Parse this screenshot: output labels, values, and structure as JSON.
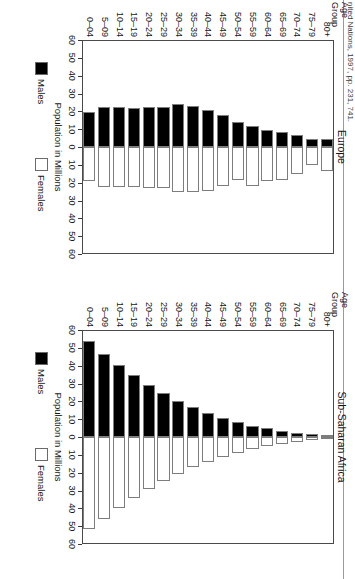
{
  "figure": {
    "source_note": "nited Nations, 1997, pp. 231, 741.",
    "orientation_note": "rotated-90"
  },
  "axis": {
    "value_axis_label": "Population in Millions",
    "category_axis_header_line1": "Age",
    "category_axis_header_line2": "Group",
    "ticks": [
      "60",
      "50",
      "40",
      "30",
      "20",
      "10",
      "0",
      "10",
      "20",
      "30",
      "40",
      "50",
      "60"
    ],
    "tick_values": [
      -60,
      -50,
      -40,
      -30,
      -20,
      -10,
      0,
      10,
      20,
      30,
      40,
      50,
      60
    ],
    "limit": 60
  },
  "legend": {
    "males_label": "Males",
    "females_label": "Females",
    "males_color": "#000000",
    "females_color": "#ffffff"
  },
  "chart_data": [
    {
      "type": "bar",
      "title": "Sub-Saharan Africa",
      "xlabel": "Population in Millions",
      "ylabel": "Age Group",
      "xlim": [
        -60,
        60
      ],
      "grid": false,
      "legend_position": "bottom",
      "categories": [
        "80+",
        "75–79",
        "70–74",
        "65–69",
        "60–64",
        "55–59",
        "50–54",
        "45–49",
        "40–44",
        "35–39",
        "30–34",
        "25–29",
        "20–24",
        "15–19",
        "10–14",
        "5–09",
        "0–04"
      ],
      "series": [
        {
          "name": "Males",
          "values": [
            0.9,
            1.5,
            2.2,
            3.3,
            4.8,
            6.3,
            8.3,
            10.6,
            13.4,
            16.6,
            20.4,
            24.6,
            29.4,
            34.6,
            40.3,
            46.5,
            54.0
          ]
        },
        {
          "name": "Females",
          "values": [
            1.1,
            1.8,
            2.6,
            3.8,
            5.3,
            6.8,
            8.8,
            11.2,
            13.9,
            17.0,
            20.7,
            24.8,
            29.4,
            34.4,
            39.9,
            45.8,
            51.4
          ]
        }
      ]
    },
    {
      "type": "bar",
      "title": "Europe",
      "xlabel": "Population in Millions",
      "ylabel": "Age Group",
      "xlim": [
        -60,
        60
      ],
      "grid": false,
      "legend_position": "bottom",
      "categories": [
        "80+",
        "75–79",
        "70–74",
        "65–69",
        "60–64",
        "55–59",
        "50–54",
        "45–49",
        "40–44",
        "35–39",
        "30–34",
        "25–29",
        "20–24",
        "15–19",
        "10–14",
        "5–09",
        "0–04"
      ],
      "series": [
        {
          "name": "Males",
          "values": [
            4.7,
            4.5,
            6.6,
            8.6,
            9.4,
            11.9,
            13.9,
            17.9,
            20.6,
            22.8,
            24.2,
            22.7,
            22.5,
            22.1,
            22.4,
            22.2,
            19.6
          ]
        },
        {
          "name": "Females",
          "values": [
            13.6,
            10.0,
            15.2,
            18.6,
            18.9,
            21.6,
            18.3,
            21.9,
            24.4,
            25.4,
            25.4,
            23.2,
            23.2,
            22.6,
            22.4,
            22.3,
            18.8
          ]
        }
      ]
    }
  ]
}
